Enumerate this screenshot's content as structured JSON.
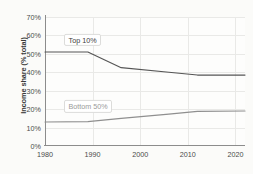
{
  "chart_data": {
    "type": "line",
    "title": "",
    "subtitle": "",
    "xlabel": "",
    "ylabel": "Income share (% total)",
    "xlim": [
      1980,
      2022
    ],
    "ylim": [
      0,
      70
    ],
    "grid": true,
    "legend_position": "inline-labels",
    "x_ticks": [
      "1980",
      "1990",
      "2000",
      "2010",
      "2020"
    ],
    "x_tick_values": [
      1980,
      1990,
      2000,
      2010,
      2020
    ],
    "y_ticks": [
      "0%",
      "10%",
      "20%",
      "30%",
      "40%",
      "50%",
      "60%",
      "70%"
    ],
    "y_tick_values": [
      0,
      10,
      20,
      30,
      40,
      50,
      60,
      70
    ],
    "series": [
      {
        "name": "Top 10%",
        "color": "#555555",
        "x": [
          1980,
          1989,
          1996,
          2006,
          2012,
          2022
        ],
        "values": [
          51.0,
          51.0,
          42.5,
          40.0,
          38.5,
          38.5
        ]
      },
      {
        "name": "Bottom 50%",
        "color": "#8f8f8f",
        "x": [
          1980,
          1989,
          1996,
          2006,
          2012,
          2022
        ],
        "values": [
          13.0,
          13.2,
          15.0,
          17.3,
          18.8,
          19.0
        ]
      }
    ],
    "annotations": [
      {
        "text": "Top 10%",
        "x": 1984,
        "y": 57.5
      },
      {
        "text": "Bottom 50%",
        "x": 1984,
        "y": 21.5
      }
    ]
  }
}
